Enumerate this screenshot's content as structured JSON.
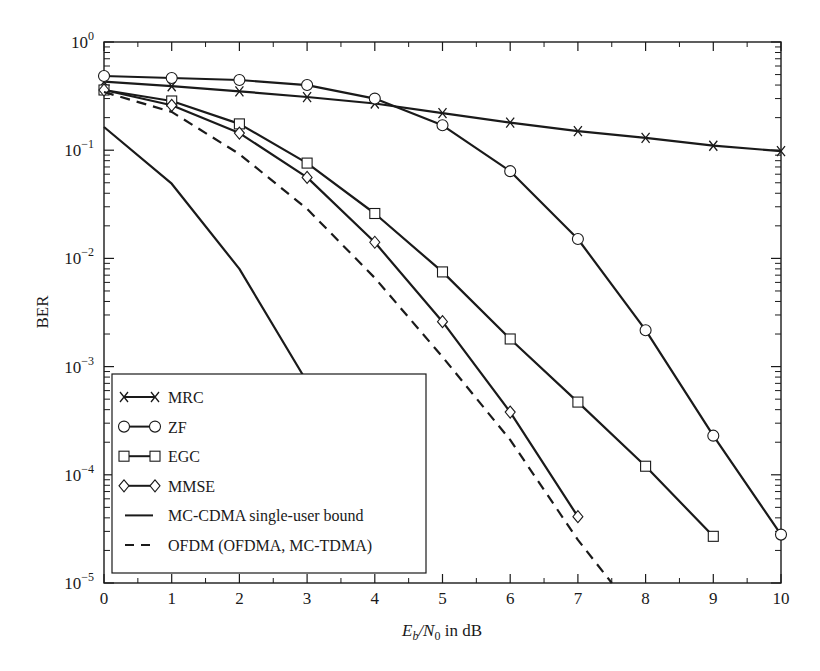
{
  "chart_data": {
    "type": "line",
    "title": "",
    "xlabel": "E_b/N_0 in dB",
    "xlabel_parts": {
      "E": "E",
      "b": "b",
      "slash": "/N",
      "zero": "0",
      "rest": " in dB"
    },
    "ylabel": "BER",
    "xlim": [
      0,
      10
    ],
    "ylim": [
      1e-05,
      1
    ],
    "yscale": "log",
    "grid": false,
    "x_ticks": [
      "0",
      "1",
      "2",
      "3",
      "4",
      "5",
      "6",
      "7",
      "8",
      "9",
      "10"
    ],
    "y_ticks": [
      {
        "base": "10",
        "exp": "0",
        "value": 1
      },
      {
        "base": "10",
        "exp": "−1",
        "value": 0.1
      },
      {
        "base": "10",
        "exp": "−2",
        "value": 0.01
      },
      {
        "base": "10",
        "exp": "−3",
        "value": 0.001
      },
      {
        "base": "10",
        "exp": "−4",
        "value": 0.0001
      },
      {
        "base": "10",
        "exp": "−5",
        "value": 1e-05
      }
    ],
    "legend_position": "lower-left",
    "series": [
      {
        "name": "MRC",
        "marker": "x",
        "dash": "solid",
        "x": [
          0,
          1,
          2,
          3,
          4,
          5,
          6,
          7,
          8,
          9,
          10
        ],
        "values": [
          0.43,
          0.39,
          0.35,
          0.31,
          0.27,
          0.22,
          0.18,
          0.15,
          0.13,
          0.11,
          0.098
        ]
      },
      {
        "name": "ZF",
        "marker": "circle",
        "dash": "solid",
        "x": [
          0,
          1,
          2,
          3,
          4,
          5,
          6,
          7,
          8,
          9,
          10
        ],
        "values": [
          0.485,
          0.465,
          0.445,
          0.4,
          0.3,
          0.17,
          0.064,
          0.0151,
          0.00217,
          0.00023,
          2.8e-05
        ]
      },
      {
        "name": "EGC",
        "marker": "square",
        "dash": "solid",
        "x": [
          0,
          1,
          2,
          3,
          4,
          5,
          6,
          7,
          8,
          9
        ],
        "values": [
          0.36,
          0.285,
          0.175,
          0.076,
          0.026,
          0.0075,
          0.0018,
          0.00047,
          0.00012,
          2.7e-05
        ]
      },
      {
        "name": "MMSE",
        "marker": "diamond",
        "dash": "solid",
        "x": [
          0,
          1,
          2,
          3,
          4,
          5,
          6,
          7
        ],
        "values": [
          0.36,
          0.26,
          0.144,
          0.056,
          0.0141,
          0.0026,
          0.00038,
          4.1e-05
        ]
      },
      {
        "name": "MC-CDMA single-user bound",
        "marker": "none",
        "dash": "solid",
        "x": [
          0,
          1,
          2,
          3
        ],
        "values": [
          0.164,
          0.049,
          0.008,
          0.00072
        ]
      },
      {
        "name": "OFDM (OFDMA, MC-TDMA)",
        "marker": "none",
        "dash": "dashed",
        "x": [
          0,
          1,
          2,
          3,
          4,
          5,
          6,
          7,
          7.5
        ],
        "values": [
          0.345,
          0.226,
          0.092,
          0.0287,
          0.0066,
          0.00123,
          0.00021,
          2.5e-05,
          1e-05
        ]
      }
    ]
  },
  "legend": {
    "items": [
      {
        "label": "MRC",
        "marker": "x",
        "dash": "solid"
      },
      {
        "label": "ZF",
        "marker": "circle",
        "dash": "solid"
      },
      {
        "label": "EGC",
        "marker": "square",
        "dash": "solid"
      },
      {
        "label": "MMSE",
        "marker": "diamond",
        "dash": "solid"
      },
      {
        "label": "MC-CDMA single-user bound",
        "marker": "none",
        "dash": "solid"
      },
      {
        "label": "OFDM (OFDMA, MC-TDMA)",
        "marker": "none",
        "dash": "dashed"
      }
    ]
  },
  "colors": {
    "line": "#1a1a1a",
    "background": "#ffffff"
  }
}
